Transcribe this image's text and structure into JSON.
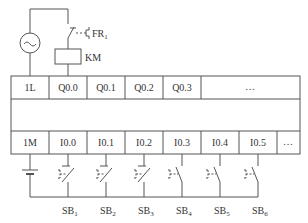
{
  "diagram": {
    "type": "PLC wiring diagram",
    "colors": {
      "line": "#555555",
      "text": "#333333",
      "background": "#ffffff"
    },
    "output_circuit": {
      "source_label": "~",
      "thermal_relay": {
        "label": "FR",
        "subscript": "1"
      },
      "coil": {
        "label": "KM"
      }
    },
    "output_terminals": [
      "1L",
      "Q0.0",
      "Q0.1",
      "Q0.2",
      "Q0.3",
      "…"
    ],
    "input_terminals": [
      "1M",
      "I0.0",
      "I0.1",
      "I0.2",
      "I0.3",
      "I0.4",
      "I0.5",
      "…"
    ],
    "switches": [
      {
        "label": "SB",
        "subscript": "1",
        "type": "normally-closed"
      },
      {
        "label": "SB",
        "subscript": "2",
        "type": "normally-closed"
      },
      {
        "label": "SB",
        "subscript": "3",
        "type": "normally-closed"
      },
      {
        "label": "SB",
        "subscript": "4",
        "type": "normally-open"
      },
      {
        "label": "SB",
        "subscript": "5",
        "type": "normally-open"
      },
      {
        "label": "SB",
        "subscript": "6",
        "type": "normally-open"
      }
    ]
  }
}
